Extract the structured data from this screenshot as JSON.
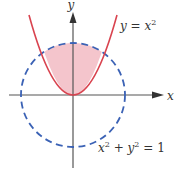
{
  "figure": {
    "colors": {
      "axis": "#555555",
      "parabola": "#d9434f",
      "circle": "#3b62b5",
      "shaded_region": "#f4c5cc",
      "label": "#333333"
    },
    "axes": {
      "x_label": "x",
      "y_label": "y"
    },
    "curves": [
      {
        "name": "parabola",
        "equation": "y = x²",
        "label_lhs": "y",
        "label_eq": " = ",
        "label_rhs_base": "x",
        "label_rhs_exp": "2",
        "style": "solid"
      },
      {
        "name": "circle",
        "equation": "x² + y² = 1",
        "label_part1_base": "x",
        "label_part1_exp": "2",
        "label_plus": " + ",
        "label_part2_base": "y",
        "label_part2_exp": "2",
        "label_eq": " = ",
        "label_rhs": "1",
        "style": "dashed"
      }
    ],
    "shaded_region": "Area inside the circle and above the parabola"
  }
}
